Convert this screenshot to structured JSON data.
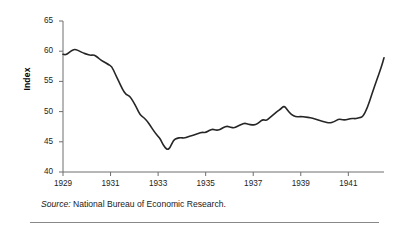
{
  "figure": {
    "y_axis_title": "Index",
    "source_lead": "Source:",
    "source_text": "National Bureau of Economic Research."
  },
  "chart_data": {
    "type": "line",
    "title": "",
    "subtitle": "",
    "xlabel": "",
    "ylabel": "Index",
    "xlim": [
      1929.0,
      1942.5
    ],
    "ylim": [
      40,
      65
    ],
    "grid": false,
    "legend": null,
    "line_color": "#262626",
    "line_width_px": 1.6,
    "y_ticks": [
      40,
      45,
      50,
      55,
      60,
      65
    ],
    "y_tick_labels": [
      "40",
      "45",
      "50",
      "55",
      "60",
      "65"
    ],
    "x_ticks": [
      1929,
      1931,
      1933,
      1935,
      1937,
      1939,
      1941
    ],
    "x_tick_labels": [
      "1929",
      "1931",
      "1933",
      "1935",
      "1937",
      "1939",
      "1941"
    ],
    "x_minor_interval": 0.25,
    "series": [
      {
        "name": "Index",
        "x": [
          1929.0,
          1929.1,
          1929.2,
          1929.3,
          1929.4,
          1929.5,
          1929.6,
          1929.7,
          1929.85,
          1930.0,
          1930.15,
          1930.3,
          1930.45,
          1930.6,
          1930.75,
          1930.9,
          1931.05,
          1931.2,
          1931.35,
          1931.5,
          1931.65,
          1931.8,
          1931.95,
          1932.1,
          1932.25,
          1932.4,
          1932.55,
          1932.7,
          1932.85,
          1933.0,
          1933.1,
          1933.2,
          1933.3,
          1933.4,
          1933.5,
          1933.65,
          1933.8,
          1933.95,
          1934.1,
          1934.25,
          1934.4,
          1934.55,
          1934.7,
          1934.85,
          1935.0,
          1935.15,
          1935.3,
          1935.45,
          1935.6,
          1935.75,
          1935.9,
          1936.05,
          1936.2,
          1936.35,
          1936.5,
          1936.65,
          1936.8,
          1936.95,
          1937.1,
          1937.25,
          1937.4,
          1937.55,
          1937.7,
          1937.85,
          1938.0,
          1938.15,
          1938.3,
          1938.45,
          1938.6,
          1938.8,
          1939.0,
          1939.2,
          1939.4,
          1939.6,
          1939.8,
          1940.0,
          1940.2,
          1940.4,
          1940.6,
          1940.8,
          1941.0,
          1941.15,
          1941.3,
          1941.45,
          1941.6,
          1941.8,
          1942.0,
          1942.2,
          1942.4,
          1942.5
        ],
        "values": [
          59.5,
          59.4,
          59.6,
          59.9,
          60.2,
          60.3,
          60.2,
          60.0,
          59.7,
          59.5,
          59.3,
          59.4,
          59.0,
          58.5,
          58.2,
          57.8,
          57.5,
          56.2,
          55.0,
          53.7,
          52.8,
          52.6,
          51.7,
          50.6,
          49.4,
          49.0,
          48.4,
          47.5,
          46.6,
          45.9,
          45.4,
          44.6,
          44.0,
          43.7,
          44.0,
          45.3,
          45.6,
          45.7,
          45.6,
          45.8,
          46.0,
          46.2,
          46.4,
          46.6,
          46.5,
          46.9,
          47.1,
          46.9,
          47.0,
          47.4,
          47.6,
          47.4,
          47.3,
          47.6,
          47.9,
          48.1,
          47.9,
          47.8,
          47.8,
          48.2,
          48.7,
          48.5,
          49.0,
          49.5,
          50.0,
          50.4,
          51.0,
          50.2,
          49.5,
          49.1,
          49.2,
          49.1,
          49.0,
          48.8,
          48.5,
          48.3,
          48.1,
          48.3,
          48.8,
          48.6,
          48.7,
          48.9,
          48.8,
          49.0,
          49.1,
          50.6,
          53.0,
          55.3,
          57.5,
          58.9
        ]
      }
    ]
  }
}
